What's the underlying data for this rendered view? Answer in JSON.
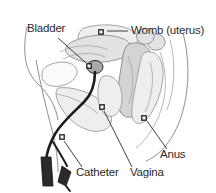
{
  "figure": {
    "background_color": "#ffffff",
    "label_color": "#2b2b2b",
    "catheter_color": "#1c1c1c",
    "tissue_colors": [
      "#eeeeee",
      "#e2e2e2",
      "#d4d4d4",
      "#fbfbfb"
    ],
    "outline_color": "#8e8e8e"
  },
  "labels": {
    "bladder": "Bladder",
    "womb": "Womb (uterus)",
    "anus": "Anus",
    "vagina": "Vagina",
    "catheter": "Catheter"
  },
  "annotations": [
    {
      "key": "bladder",
      "text": "Bladder",
      "label_x": 27,
      "label_y": 32,
      "marker_x": 89,
      "marker_y": 66,
      "marker_shape": "square"
    },
    {
      "key": "womb",
      "text": "Womb (uterus)",
      "label_x": 131,
      "label_y": 34,
      "marker_x": 101,
      "marker_y": 32,
      "marker_shape": "square"
    },
    {
      "key": "anus",
      "text": "Anus",
      "label_x": 160,
      "label_y": 158,
      "marker_x": 144,
      "marker_y": 118,
      "marker_shape": "square"
    },
    {
      "key": "vagina",
      "text": "Vagina",
      "label_x": 130,
      "label_y": 176,
      "marker_x": 102,
      "marker_y": 107,
      "marker_shape": "square"
    },
    {
      "key": "catheter",
      "text": "Catheter",
      "label_x": 76,
      "label_y": 176,
      "marker_x": 62,
      "marker_y": 137,
      "marker_shape": "square"
    }
  ]
}
